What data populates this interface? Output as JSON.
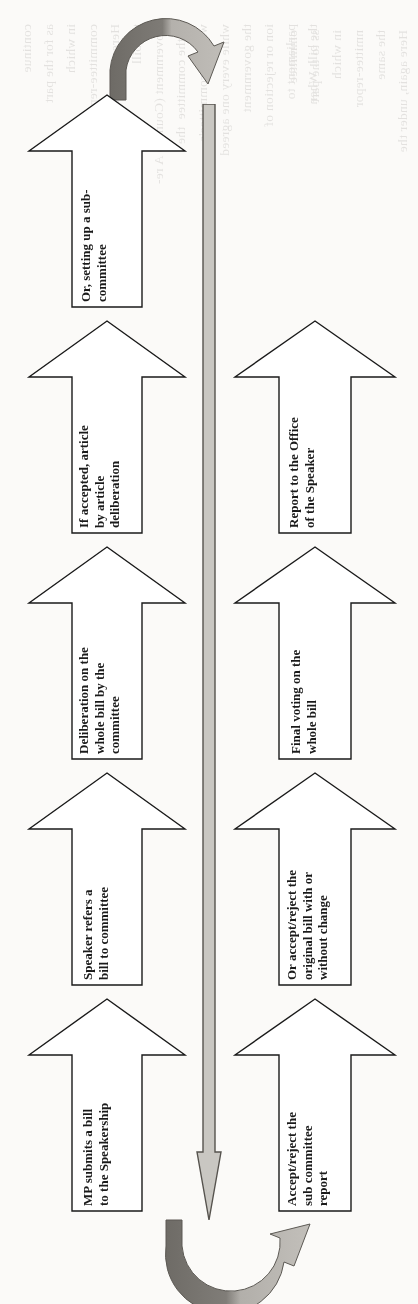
{
  "diagram": {
    "orientation": "rotated-90",
    "colors": {
      "outline": "#1a1a1a",
      "spine_fill": "#c9c7c2",
      "spine_outline": "#56534e",
      "curve_dark": "#6e6b66",
      "curve_light": "#b9b6b1",
      "page_background": "#fbfaf8",
      "text": "#1a1a1a"
    },
    "left_column": {
      "name": "bill-introduction-stages",
      "arrows": [
        {
          "id": "arrow-sub-committee",
          "label": "Or, setting up a sub-\ncommittee"
        },
        {
          "id": "arrow-article-deliberation",
          "label": "If accepted, article\nby article\ndeliberation"
        },
        {
          "id": "arrow-whole-bill-committee",
          "label": "Deliberation on the\nwhole bill by the\ncommittee"
        },
        {
          "id": "arrow-speaker-refers",
          "label": "Speaker refers a\nbill to committee"
        },
        {
          "id": "arrow-mp-submits",
          "label": "MP submits a bill\nto the Speakership"
        }
      ]
    },
    "right_column": {
      "name": "bill-reporting-stages",
      "arrows": [
        {
          "id": "arrow-report-speaker",
          "label": "Report to the Office\nof the Speaker"
        },
        {
          "id": "arrow-final-voting",
          "label": "Final voting on the\nwhole bill"
        },
        {
          "id": "arrow-accept-reject-original",
          "label": "Or accept/reject the\noriginal bill with or\nwithout change"
        },
        {
          "id": "arrow-accept-reject-sub",
          "label": "Accept/reject the\nsub committee\nreport"
        }
      ]
    },
    "spine": {
      "name": "central-flow-arrow",
      "direction": "down"
    },
    "curves": [
      {
        "id": "curve-top",
        "name": "return-curve-top",
        "direction": "clockwise"
      },
      {
        "id": "curve-bottom",
        "name": "return-curve-bottom",
        "direction": "counter-clockwise"
      }
    ]
  },
  "bleed_text": {
    "column_a": "ommittee\nss to the part\nin which\nnmittee-repor\nthe same\nHere again, under the\nthe bill\nnt Commit   A re-\nin the committee  the\nwith the committee's\nwhile every one agree\nthe government\non or rejection of\nparliament to\nthe bill. When\n\nmany of the\nthe Presidential\npublic in the\nfor a bill to\nthe parliament\nwho are able\nthe discussion\nthe government\ncan be deliberated\nand, thus, increases\nmore difficult for\nthem to pass",
    "column_b": "continue\nas for the part\nin which\ncommittee-report\nHere again, under the\nthe bill\nGovernment (Council) A re-\nin the committee  the\nwith the committee's\nwhile every one agreed\nthe government\nion or rejection of\nparliament to\nthe bill. When"
  }
}
